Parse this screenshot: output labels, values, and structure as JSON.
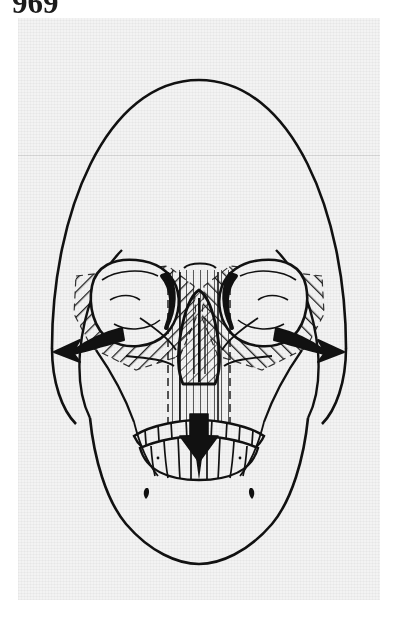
{
  "page": {
    "number": "969",
    "background_color": "#ffffff",
    "panel_background_color": "#f3f3f3",
    "ink_color": "#111111"
  },
  "figure": {
    "name": "skull-anteroposterior-diagram",
    "view": "anteroposterior",
    "regions": [
      {
        "name": "cranial-vault",
        "label": "Cranial vault"
      },
      {
        "name": "left-orbit",
        "label": "Left orbit"
      },
      {
        "name": "right-orbit",
        "label": "Right orbit"
      },
      {
        "name": "left-zygoma-hatched",
        "label": "Left zygomatic / maxillary hatched segment"
      },
      {
        "name": "right-zygoma-hatched",
        "label": "Right zygomatic / maxillary hatched segment"
      },
      {
        "name": "nasal-aperture",
        "label": "Nasal aperture"
      },
      {
        "name": "nasal-septum",
        "label": "Nasal septum"
      },
      {
        "name": "maxillary-dentition",
        "label": "Maxillary dentition"
      },
      {
        "name": "mandibular-dentition",
        "label": "Mandibular dentition"
      },
      {
        "name": "mandible",
        "label": "Mandible"
      },
      {
        "name": "left-mental-foramen",
        "label": "Left mental foramen"
      },
      {
        "name": "right-mental-foramen",
        "label": "Right mental foramen"
      }
    ],
    "arrows": [
      {
        "name": "left-lateral-arrow",
        "direction": "left-lateral-downward",
        "style": "solid-black-curved"
      },
      {
        "name": "right-lateral-arrow",
        "direction": "right-lateral-downward",
        "style": "solid-black-curved"
      },
      {
        "name": "central-inferior-arrow",
        "direction": "downward",
        "style": "solid-black-straight"
      }
    ],
    "hatching": {
      "left_orbit_fill": "diagonal-lines-up-right",
      "right_orbit_fill": "diagonal-lines-up-left",
      "nasal_fill": "diagonal-lines-up-right",
      "midline_fill": "vertical-lines"
    }
  }
}
